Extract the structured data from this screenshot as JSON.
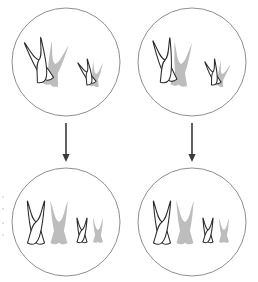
{
  "figure": {
    "background_color": "#ffffff",
    "cell_outline_color": "#8f8f8f",
    "arrow_color": "#3a3a3a",
    "chromosome_outline_color": "#2b2b2b",
    "chromosome_fill_white": "#ffffff",
    "chromosome_fill_gray": "#bdbdbd"
  },
  "cells": [
    {
      "id": "parent-cell-left",
      "label": "Parent cell left",
      "stage": "paired",
      "center": {
        "cx": 66,
        "cy": 62
      },
      "radius": 54,
      "chromosomes": [
        {
          "name": "large-white-chromosome",
          "size": "large",
          "color": "white",
          "tilt": -18
        },
        {
          "name": "large-gray-chromosome",
          "size": "large",
          "color": "gray",
          "tilt": 14
        },
        {
          "name": "small-white-chromosome",
          "size": "small",
          "color": "white",
          "tilt": -22
        },
        {
          "name": "small-gray-chromosome",
          "size": "small",
          "color": "gray",
          "tilt": 10
        }
      ]
    },
    {
      "id": "parent-cell-right",
      "label": "Parent cell right",
      "stage": "paired",
      "center": {
        "cx": 192,
        "cy": 62
      },
      "radius": 54,
      "chromosomes": [
        {
          "name": "large-white-chromosome",
          "size": "large",
          "color": "white",
          "tilt": -10
        },
        {
          "name": "large-gray-chromosome",
          "size": "large",
          "color": "gray",
          "tilt": 6
        },
        {
          "name": "small-white-chromosome",
          "size": "small",
          "color": "white",
          "tilt": -16
        },
        {
          "name": "small-gray-chromosome",
          "size": "small",
          "color": "gray",
          "tilt": 18
        }
      ]
    },
    {
      "id": "daughter-cell-left",
      "label": "Daughter cell left",
      "stage": "separated",
      "center": {
        "cx": 66,
        "cy": 222
      },
      "radius": 54,
      "chromosomes": [
        {
          "name": "large-white-chromosome",
          "size": "large",
          "color": "white",
          "tilt": 0
        },
        {
          "name": "large-gray-chromosome",
          "size": "large",
          "color": "gray",
          "tilt": 0
        },
        {
          "name": "small-white-chromosome",
          "size": "small",
          "color": "white",
          "tilt": 0
        },
        {
          "name": "small-gray-chromosome",
          "size": "small",
          "color": "gray",
          "tilt": 0
        }
      ]
    },
    {
      "id": "daughter-cell-right",
      "label": "Daughter cell right",
      "stage": "separated",
      "center": {
        "cx": 192,
        "cy": 222
      },
      "radius": 54,
      "chromosomes": [
        {
          "name": "large-white-chromosome",
          "size": "large",
          "color": "white",
          "tilt": 0
        },
        {
          "name": "large-gray-chromosome",
          "size": "large",
          "color": "gray",
          "tilt": 0
        },
        {
          "name": "small-white-chromosome",
          "size": "small",
          "color": "white",
          "tilt": 0
        },
        {
          "name": "small-gray-chromosome",
          "size": "small",
          "color": "gray",
          "tilt": 0
        }
      ]
    }
  ],
  "arrows": [
    {
      "id": "arrow-left",
      "label": "Division arrow left",
      "from": "parent-cell-left",
      "to": "daughter-cell-left",
      "x": 66,
      "y1": 123,
      "y2": 162
    },
    {
      "id": "arrow-right",
      "label": "Division arrow right",
      "from": "parent-cell-right",
      "to": "daughter-cell-right",
      "x": 192,
      "y1": 123,
      "y2": 162
    }
  ],
  "margin_artifacts": [
    {
      "x": 2,
      "y": 196,
      "w": 2,
      "h": 2
    },
    {
      "x": 2,
      "y": 208,
      "w": 2,
      "h": 2
    },
    {
      "x": 2,
      "y": 222,
      "w": 2,
      "h": 2
    },
    {
      "x": 2,
      "y": 234,
      "w": 2,
      "h": 2
    }
  ]
}
